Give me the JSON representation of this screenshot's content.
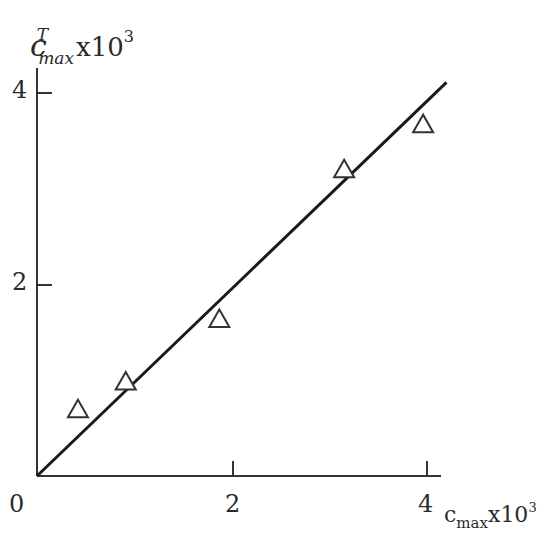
{
  "chart_data": {
    "type": "scatter",
    "title": "",
    "xlabel": "c_max x10^3",
    "ylabel": "c^T_max x10^3",
    "x_ticks": [
      "0",
      "2",
      "4"
    ],
    "y_ticks": [
      "2",
      "4"
    ],
    "xlim": [
      0,
      4.3
    ],
    "ylim": [
      0,
      4.2
    ],
    "grid": false,
    "legend": null,
    "series": [
      {
        "name": "data",
        "marker": "open-triangle",
        "points": [
          {
            "x": 0.42,
            "y": 0.69
          },
          {
            "x": 0.91,
            "y": 0.98
          },
          {
            "x": 1.87,
            "y": 1.63
          },
          {
            "x": 3.15,
            "y": 3.19
          },
          {
            "x": 3.96,
            "y": 3.66
          }
        ]
      },
      {
        "name": "y = x",
        "type": "line",
        "points": [
          {
            "x": 0,
            "y": 0
          },
          {
            "x": 4.2,
            "y": 4.1
          }
        ]
      }
    ]
  },
  "labels": {
    "y_axis": {
      "var": "c",
      "sup": "T",
      "sub": "max",
      "mult": "x10",
      "exp": "3"
    },
    "x_axis": {
      "var": "c",
      "sub": "max",
      "mult": "x10",
      "exp": "3"
    },
    "x_tick_0": "0",
    "x_tick_2": "2",
    "x_tick_4": "4",
    "y_tick_2": "2",
    "y_tick_4": "4"
  }
}
